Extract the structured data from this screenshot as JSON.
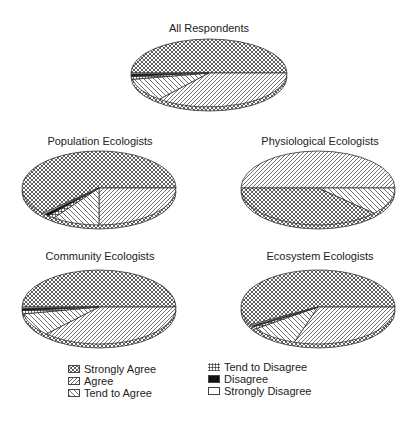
{
  "chart_data": {
    "type": "pie",
    "legend": {
      "position": "bottom",
      "entries": [
        "Strongly Agree",
        "Agree",
        "Tend to Agree",
        "Tend to Disagree",
        "Disagree",
        "Strongly Disagree"
      ]
    },
    "charts": [
      {
        "title": "All Respondents",
        "categories": [
          "Strongly Agree",
          "Agree",
          "Tend to Agree",
          "Tend to Disagree",
          "Disagree",
          "Strongly Disagree"
        ],
        "values": [
          50,
          36,
          11,
          1.5,
          1,
          0.5
        ]
      },
      {
        "title": "Population Ecologists",
        "categories": [
          "Strongly Agree",
          "Agree",
          "Tend to Agree",
          "Tend to Disagree",
          "Disagree",
          "Strongly Disagree"
        ],
        "values": [
          62,
          25,
          10,
          1.5,
          1,
          0.5
        ]
      },
      {
        "title": "Physiological Ecologists",
        "categories": [
          "Strongly Agree",
          "Agree",
          "Tend to Agree",
          "Tend to Disagree",
          "Disagree",
          "Strongly Disagree"
        ],
        "values": [
          38,
          50,
          12,
          0,
          0,
          0
        ]
      },
      {
        "title": "Community Ecologists",
        "categories": [
          "Strongly Agree",
          "Agree",
          "Tend to Agree",
          "Tend to Disagree",
          "Disagree",
          "Strongly Disagree"
        ],
        "values": [
          50,
          37,
          10,
          1.5,
          1,
          0.5
        ]
      },
      {
        "title": "Ecosystem Ecologists",
        "categories": [
          "Strongly Agree",
          "Agree",
          "Tend to Agree",
          "Tend to Disagree",
          "Disagree",
          "Strongly Disagree"
        ],
        "values": [
          58,
          30,
          10,
          1,
          0.5,
          0.5
        ]
      }
    ]
  },
  "titles": {
    "all": "All Respondents",
    "population": "Population Ecologists",
    "physiological": "Physiological Ecologists",
    "community": "Community Ecologists",
    "ecosystem": "Ecosystem Ecologists"
  },
  "legend": {
    "strongly_agree": "Strongly Agree",
    "agree": "Agree",
    "tend_to_agree": "Tend to Agree",
    "tend_to_disagree": "Tend to Disagree",
    "disagree": "Disagree",
    "strongly_disagree": "Strongly Disagree"
  }
}
